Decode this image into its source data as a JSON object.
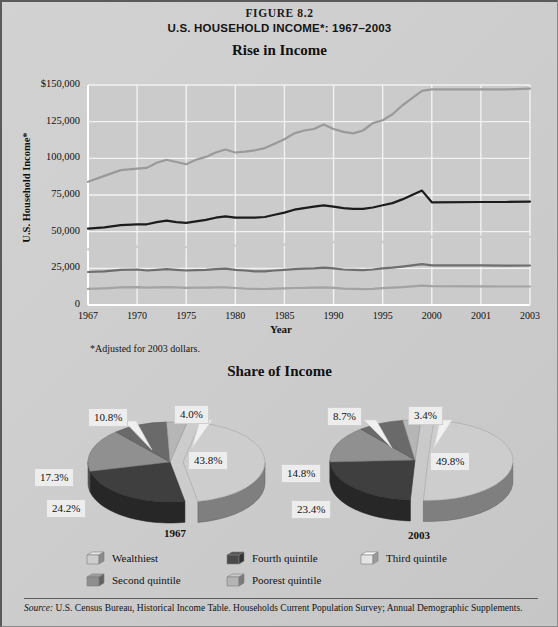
{
  "figure": {
    "number": "FIGURE 8.2",
    "title": "U.S. HOUSEHOLD INCOME*: 1967–2003"
  },
  "line_section": {
    "title": "Rise in Income",
    "ylabel": "U.S. Household Income*",
    "xlabel": "Year",
    "footnote": "*Adjusted for 2003 dollars."
  },
  "pie_section": {
    "title": "Share of Income",
    "pie1_year": "1967",
    "pie2_year": "2003"
  },
  "legend": [
    {
      "label": "Wealthiest",
      "color": "#cdcdcd"
    },
    {
      "label": "Fourth quintile",
      "color": "#4a4a4a"
    },
    {
      "label": "Third quintile",
      "color": "#e4e4e4"
    },
    {
      "label": "Second quintile",
      "color": "#8e8e8e"
    },
    {
      "label": "Poorest quintile",
      "color": "#b4b4b4"
    }
  ],
  "source": {
    "prefix": "Source:",
    "text": " U.S. Census Bureau, Historical Income Table. Households Current Population Survey; Annual Demographic Supplements."
  },
  "chart_data": [
    {
      "type": "line",
      "title": "Rise in Income",
      "xlabel": "Year",
      "ylabel": "U.S. Household Income*",
      "ylim": [
        0,
        150000
      ],
      "yticks": [
        "0",
        "25,000",
        "50,000",
        "75,000",
        "100,000",
        "125,000",
        "$150,000"
      ],
      "ytick_values": [
        0,
        25000,
        50000,
        75000,
        100000,
        125000,
        150000
      ],
      "grid": true,
      "legend_position": "below-pies",
      "xticks": [
        "1967",
        "1970",
        "1975",
        "1980",
        "1985",
        "1990",
        "1995",
        "2000",
        "2001",
        "2003"
      ],
      "x": [
        1967,
        1968,
        1969,
        1970,
        1971,
        1972,
        1973,
        1974,
        1975,
        1976,
        1977,
        1978,
        1979,
        1980,
        1981,
        1982,
        1983,
        1984,
        1985,
        1986,
        1987,
        1988,
        1989,
        1990,
        1991,
        1992,
        1993,
        1994,
        1995,
        1996,
        1997,
        1998,
        1999,
        2000,
        2001,
        2002,
        2003
      ],
      "series": [
        {
          "name": "Wealthiest",
          "color": "#9a9a9a",
          "values": [
            84000,
            88000,
            92000,
            93000,
            93500,
            97000,
            99000,
            97500,
            96000,
            99000,
            101000,
            104000,
            106000,
            104000,
            104500,
            105500,
            107000,
            110000,
            113000,
            117000,
            119000,
            120000,
            123000,
            120000,
            118000,
            117000,
            119000,
            124000,
            126000,
            130000,
            136000,
            141000,
            146000,
            147000,
            147000,
            147000,
            147500
          ]
        },
        {
          "name": "Fourth quintile",
          "color": "#1c1c1c",
          "values": [
            52000,
            53000,
            54500,
            55000,
            55000,
            56500,
            57500,
            56500,
            56000,
            57000,
            58000,
            59500,
            60500,
            59500,
            59500,
            59500,
            60000,
            61500,
            63000,
            65000,
            66000,
            67000,
            68000,
            67000,
            66000,
            65500,
            65500,
            66500,
            68000,
            69500,
            72000,
            75000,
            78000,
            70000,
            70200,
            70200,
            70500
          ]
        },
        {
          "name": "Third quintile",
          "color": "#cbcbcb",
          "values": [
            38000,
            38800,
            39500,
            39800,
            39600,
            40500,
            41000,
            40200,
            39500,
            40000,
            40200,
            41000,
            41500,
            40500,
            40000,
            39800,
            39700,
            40500,
            41200,
            42200,
            42500,
            43000,
            43500,
            42800,
            42000,
            41500,
            41500,
            42000,
            43000,
            43800,
            45000,
            46500,
            47800,
            46500,
            46500,
            46300,
            46400
          ]
        },
        {
          "name": "Second quintile",
          "color": "#6e6e6e",
          "values": [
            22500,
            23000,
            24000,
            24200,
            23500,
            24000,
            24500,
            24000,
            23500,
            23800,
            24000,
            24500,
            24800,
            24000,
            23500,
            23000,
            23000,
            23500,
            24000,
            24500,
            24800,
            25000,
            25400,
            25000,
            24200,
            24000,
            23800,
            24200,
            25000,
            25500,
            26200,
            27000,
            27800,
            27000,
            27000,
            26800,
            26900
          ]
        },
        {
          "name": "Poorest quintile",
          "color": "#a3a3a3",
          "values": [
            11000,
            11400,
            12000,
            12200,
            11800,
            12000,
            12200,
            12000,
            11700,
            11800,
            11800,
            12000,
            12100,
            11600,
            11200,
            11000,
            10900,
            11100,
            11300,
            11600,
            11700,
            11800,
            12000,
            11700,
            11200,
            11000,
            10800,
            11000,
            11500,
            11800,
            12200,
            12700,
            13200,
            12800,
            12700,
            12600,
            12600
          ]
        }
      ]
    },
    {
      "type": "pie",
      "title": "1967",
      "labels": [
        "Wealthiest",
        "Fourth quintile",
        "Third quintile",
        "Second quintile",
        "Poorest quintile"
      ],
      "values": [
        43.8,
        24.2,
        17.3,
        10.8,
        4.0
      ],
      "value_labels": [
        "43.8%",
        "24.2%",
        "17.3%",
        "10.8%",
        "4.0%"
      ],
      "colors": [
        "#cdcdcd",
        "#3f3f3f",
        "#909090",
        "#6a6a6a",
        "#b6b6b6"
      ]
    },
    {
      "type": "pie",
      "title": "2003",
      "labels": [
        "Wealthiest",
        "Fourth quintile",
        "Third quintile",
        "Second quintile",
        "Poorest quintile"
      ],
      "values": [
        49.8,
        23.4,
        14.8,
        8.7,
        3.4
      ],
      "value_labels": [
        "49.8%",
        "23.4%",
        "14.8%",
        "8.7%",
        "3.4%"
      ],
      "colors": [
        "#cdcdcd",
        "#3f3f3f",
        "#909090",
        "#6a6a6a",
        "#b6b6b6"
      ]
    }
  ]
}
